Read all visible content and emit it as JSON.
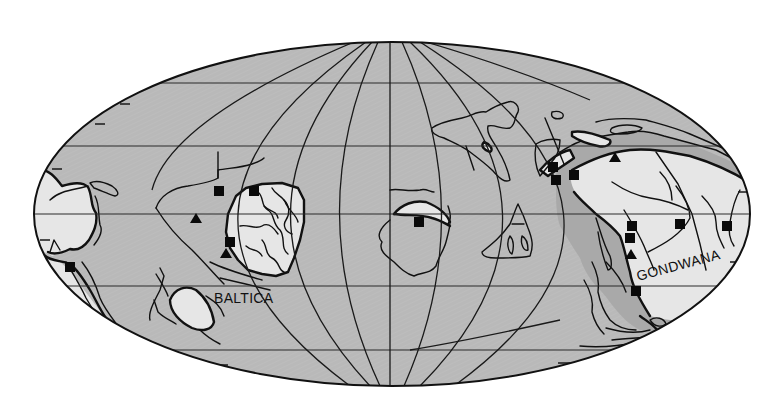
{
  "map": {
    "projection": "mollweide-style equal-area ellipse",
    "colors": {
      "ocean": "#b9b9b9",
      "shelf": "#a9a9a9",
      "craton": "#e6e6e6",
      "line": "#111111",
      "background": "#ffffff"
    },
    "labels": {
      "baltica": "BALTICA",
      "gondwana": "GONDWANA"
    },
    "legend_symbols": {
      "square": "square-marker",
      "triangle": "triangle-marker"
    },
    "square_markers": [
      {
        "x": 219,
        "y": 191
      },
      {
        "x": 254,
        "y": 191
      },
      {
        "x": 230,
        "y": 242
      },
      {
        "x": 70,
        "y": 267
      },
      {
        "x": 419,
        "y": 222
      },
      {
        "x": 554,
        "y": 167
      },
      {
        "x": 556,
        "y": 180
      },
      {
        "x": 575,
        "y": 175
      },
      {
        "x": 632,
        "y": 226
      },
      {
        "x": 630,
        "y": 238
      },
      {
        "x": 680,
        "y": 224
      },
      {
        "x": 727,
        "y": 226
      },
      {
        "x": 636,
        "y": 291
      }
    ],
    "triangle_markers": [
      {
        "x": 196,
        "y": 219
      },
      {
        "x": 226,
        "y": 254
      },
      {
        "x": 615,
        "y": 158
      },
      {
        "x": 631,
        "y": 254
      }
    ]
  }
}
